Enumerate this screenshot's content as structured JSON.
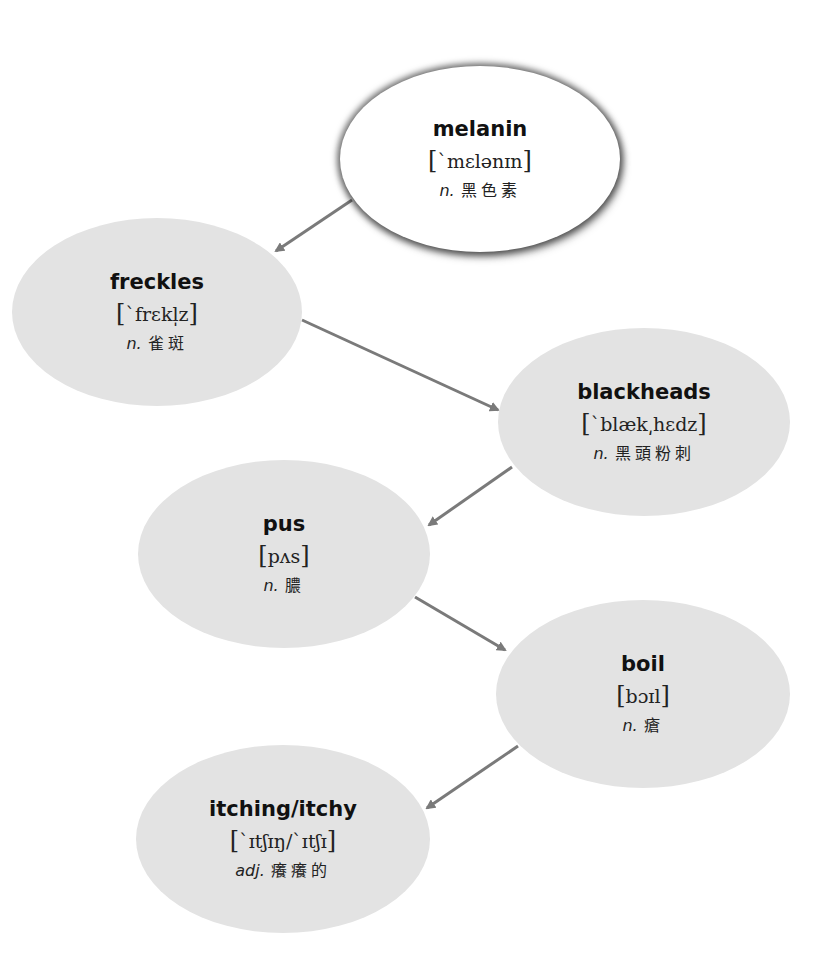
{
  "diagram": {
    "type": "vocabulary-flow",
    "colors": {
      "root_fill": "#ffffff",
      "node_fill": "#e3e3e3",
      "arrow": "#7a7a7a",
      "text": "#111111"
    },
    "nodes": [
      {
        "id": "melanin",
        "word": "melanin",
        "ipa": "`mɛlənɪn",
        "pos": "n.",
        "meaning": "黑色素"
      },
      {
        "id": "freckles",
        "word": "freckles",
        "ipa": "`frɛkl̩z",
        "pos": "n.",
        "meaning": "雀斑"
      },
      {
        "id": "blackheads",
        "word": "blackheads",
        "ipa": "`blæk͵hɛdz",
        "pos": "n.",
        "meaning": "黑頭粉刺"
      },
      {
        "id": "pus",
        "word": "pus",
        "ipa": "pʌs",
        "pos": "n.",
        "meaning": "膿"
      },
      {
        "id": "boil",
        "word": "boil",
        "ipa": "bɔɪl",
        "pos": "n.",
        "meaning": "瘡"
      },
      {
        "id": "itching",
        "word": "itching/itchy",
        "ipa": "`ɪtʃɪŋ/`ɪtʃɪ",
        "pos": "adj.",
        "meaning": "癢癢的"
      }
    ],
    "edges": [
      {
        "from": "melanin",
        "to": "freckles"
      },
      {
        "from": "freckles",
        "to": "blackheads"
      },
      {
        "from": "blackheads",
        "to": "pus"
      },
      {
        "from": "pus",
        "to": "boil"
      },
      {
        "from": "boil",
        "to": "itching"
      }
    ],
    "brackets": {
      "open": "[",
      "close": "]"
    }
  }
}
